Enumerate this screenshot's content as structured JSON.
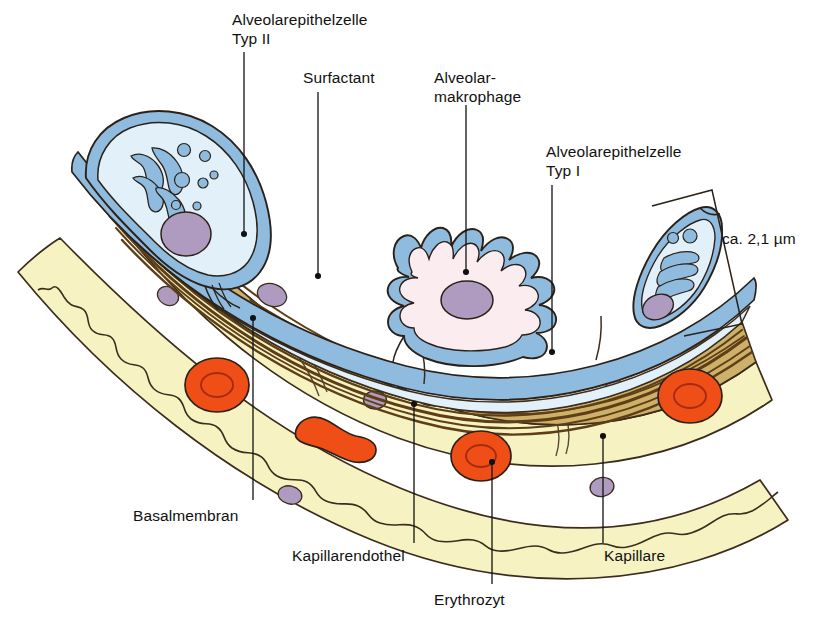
{
  "figure": {
    "scale_note": "ca. 2,1 µm"
  },
  "labels": {
    "type2": "Alveolarepithelzelle\nTyp II",
    "surfactant": "Surfactant",
    "macrophage": "Alveolar-\nmakrophage",
    "type1": "Alveolarepithelzelle\nTyp I",
    "thickness": "ca. 2,1 µm",
    "basalmembran": "Basalmembran",
    "kapillarendothel": "Kapillarendothel",
    "erythrozyt": "Erythrozyt",
    "kapillare": "Kapillare"
  },
  "colors": {
    "membrane_blue": "#8FBBDF",
    "cytoplasm_blue": "#E2F0F9",
    "macrophage_cytoplasm": "#FBECEF",
    "nucleus_purple": "#B09BC0",
    "basement_tan": "#CDB06A",
    "basement_fiber": "#5E3E14",
    "capillary_yellow": "#F6F2C2",
    "erythrocyte_red": "#F04E17",
    "outline": "#2B2118",
    "leader_line": "#111111",
    "text": "#111111"
  },
  "structures": [
    {
      "name": "alveolar-epithelial-cell-type-2-left",
      "kind": "cell",
      "organelles": [
        "lamellar-body",
        "vesicles",
        "nucleus"
      ]
    },
    {
      "name": "alveolar-epithelial-cell-type-2-right",
      "kind": "cell",
      "organelles": [
        "lamellar-body",
        "vesicles",
        "nucleus"
      ]
    },
    {
      "name": "alveolar-macrophage",
      "kind": "cell",
      "organelles": [
        "nucleus"
      ]
    },
    {
      "name": "surfactant-film",
      "kind": "layer"
    },
    {
      "name": "alveolar-epithelial-cell-type-1",
      "kind": "layer"
    },
    {
      "name": "basement-membrane",
      "kind": "layer"
    },
    {
      "name": "capillary-endothelium-upper",
      "kind": "layer"
    },
    {
      "name": "capillary-endothelium-lower",
      "kind": "layer"
    },
    {
      "name": "capillary-lumen",
      "kind": "space"
    },
    {
      "name": "erythrocyte-face-view",
      "kind": "cell",
      "count": 3
    },
    {
      "name": "erythrocyte-edge-view",
      "kind": "cell",
      "count": 1
    }
  ]
}
